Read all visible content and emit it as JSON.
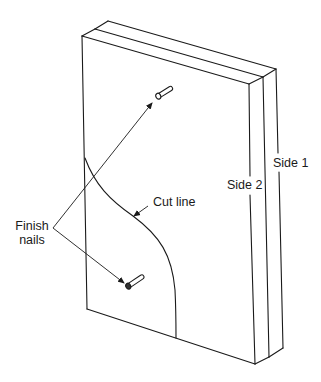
{
  "diagram": {
    "type": "isometric-panel-illustration",
    "colors": {
      "line": "#1a1a1a",
      "background": "#ffffff"
    },
    "labels": {
      "finish_nails_line1": "Finish",
      "finish_nails_line2": "nails",
      "cut_line": "Cut line",
      "side_1": "Side 1",
      "side_2": "Side 2"
    },
    "parts": [
      {
        "name": "Side 1",
        "role": "back panel"
      },
      {
        "name": "Side 2",
        "role": "front panel"
      },
      {
        "name": "Finish nails",
        "count": 2
      },
      {
        "name": "Cut line",
        "shape": "S-curve"
      }
    ]
  }
}
